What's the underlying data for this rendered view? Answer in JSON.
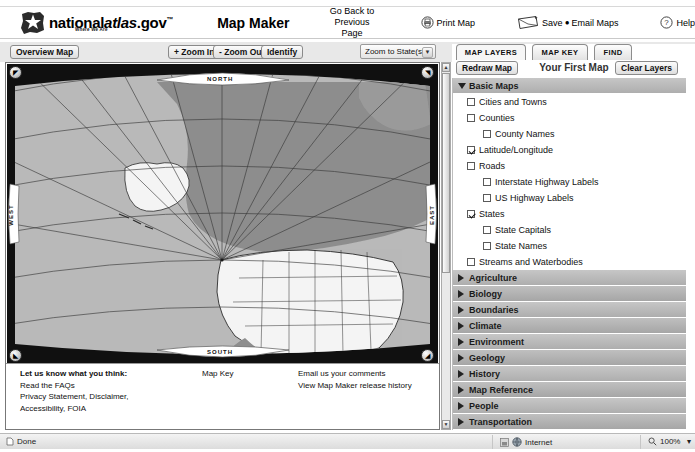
{
  "header": {
    "logo_text_1": "national",
    "logo_text_2": "atlas",
    "logo_text_3": ".gov",
    "logo_tm": "™",
    "logo_tagline": "Where We Are",
    "app_title": "Map Maker",
    "back_link": "Go Back to Previous Page",
    "print_label": "Print Map",
    "save_label": "Save",
    "save_sep": "●",
    "email_label": "Email Maps",
    "help_label": "Help",
    "icons": {
      "print": "printer-icon",
      "save": "envelope-icon",
      "help": "question-circle-icon"
    }
  },
  "toolbar": {
    "overview_map": "Overview Map",
    "zoom_in": "+ Zoom In",
    "zoom_out": "- Zoom Out",
    "identify": "Identify",
    "zoom_to_state_selected": "Zoom to State(s)",
    "zoom_to_state_options": [
      "Zoom to State(s)"
    ],
    "caret": "▼"
  },
  "map": {
    "north": "NORTH",
    "south": "SOUTH",
    "east": "EAST",
    "west": "WEST",
    "nav_nw": "◤",
    "nav_ne": "◥",
    "nav_sw": "◣",
    "nav_se": "◢",
    "colors": {
      "ocean": "#b9b9b9",
      "land_foreign": "#8e8e8e",
      "land_us": "#f4f4f4",
      "graticule": "#3a3a3a",
      "border": "#222222",
      "frame": "#0d0d0d"
    }
  },
  "map_footer": {
    "col1_line1": "Let us know what you think:",
    "col1_line2": "Read the FAQs",
    "col1_line3": "Privacy Statement, Disclaimer,",
    "col1_line4": "Accessibility, FOIA",
    "col2_line1": "Map Key",
    "col3_line1": "Email us your comments",
    "col3_line2": "View Map Maker release history"
  },
  "panel": {
    "tabs": [
      {
        "label": "MAP LAYERS",
        "active": true
      },
      {
        "label": "MAP KEY",
        "active": false
      },
      {
        "label": "FIND",
        "active": false
      }
    ],
    "redraw_label": "Redraw Map",
    "map_title": "Your First Map",
    "clear_label": "Clear Layers",
    "basic_maps": {
      "label": "Basic Maps",
      "expanded": true,
      "items": [
        {
          "label": "Cities and Towns",
          "checked": false,
          "level": 1
        },
        {
          "label": "Counties",
          "checked": false,
          "level": 1
        },
        {
          "label": "County Names",
          "checked": false,
          "level": 2
        },
        {
          "label": "Latitude/Longitude",
          "checked": true,
          "level": 1
        },
        {
          "label": "Roads",
          "checked": false,
          "level": 1
        },
        {
          "label": "Interstate Highway Labels",
          "checked": false,
          "level": 2
        },
        {
          "label": "US Highway Labels",
          "checked": false,
          "level": 2
        },
        {
          "label": "States",
          "checked": true,
          "level": 1
        },
        {
          "label": "State Capitals",
          "checked": false,
          "level": 2
        },
        {
          "label": "State Names",
          "checked": false,
          "level": 2
        },
        {
          "label": "Streams and Waterbodies",
          "checked": false,
          "level": 1
        }
      ]
    },
    "categories": [
      {
        "label": "Agriculture"
      },
      {
        "label": "Biology"
      },
      {
        "label": "Boundaries"
      },
      {
        "label": "Climate"
      },
      {
        "label": "Environment"
      },
      {
        "label": "Geology"
      },
      {
        "label": "History"
      },
      {
        "label": "Map Reference"
      },
      {
        "label": "People"
      },
      {
        "label": "Transportation"
      },
      {
        "label": "Water"
      }
    ]
  },
  "statusbar": {
    "status_text": "Done",
    "zone_text": "Internet",
    "zoom_text": "100%",
    "zoom_caret": "▾"
  }
}
